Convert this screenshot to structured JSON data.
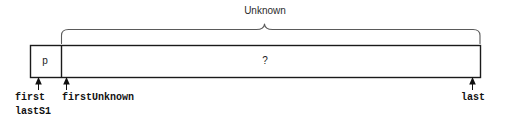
{
  "diagram": {
    "title": "Unknown",
    "brace_label": "Unknown",
    "cells": [
      {
        "id": "partition-p",
        "label": "p"
      },
      {
        "id": "unknown-region",
        "label": "?"
      }
    ],
    "pointers": [
      {
        "id": "first",
        "label": "first"
      },
      {
        "id": "lastS1",
        "label": "lastS1"
      },
      {
        "id": "firstUnknown",
        "label": "firstUnknown"
      },
      {
        "id": "last",
        "label": "last"
      }
    ],
    "colors": {
      "stroke": "#1a1a1a",
      "brace": "#555555",
      "text": "#111111",
      "label_text": "#2b2b2b",
      "background": "#ffffff"
    }
  }
}
